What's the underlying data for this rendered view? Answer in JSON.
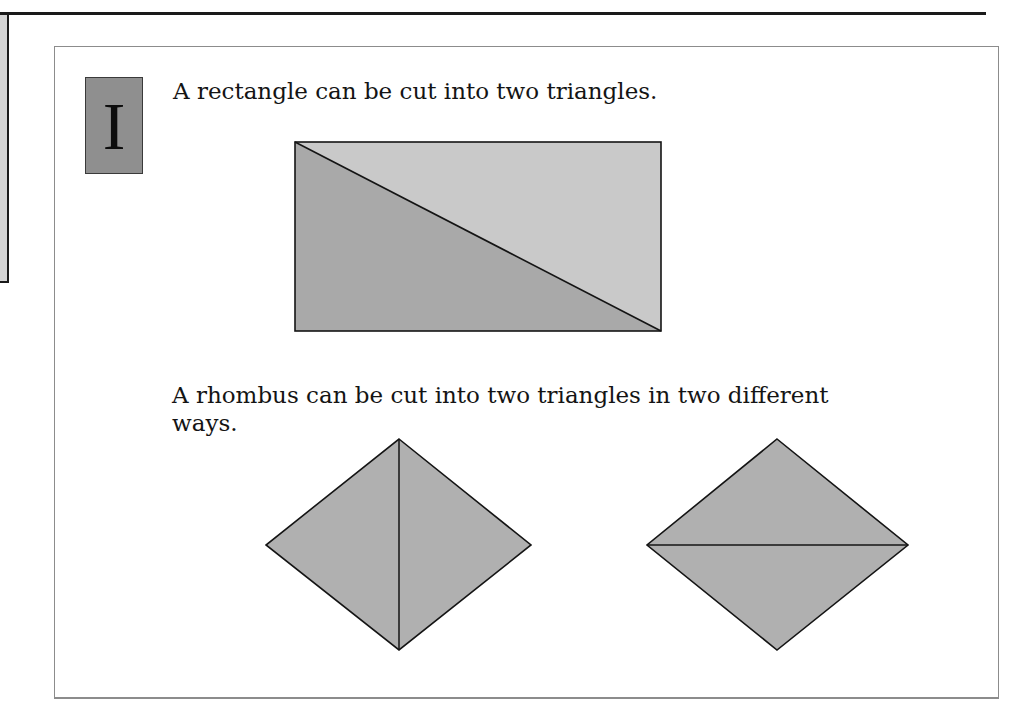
{
  "page": {
    "section_badge": "I",
    "statements": [
      "A rectangle can be cut into two triangles.",
      "A rhombus can be cut into two triangles in two different",
      "ways."
    ]
  },
  "figures": {
    "rectangle": {
      "description": "Rectangle split by a diagonal into two triangles",
      "upper_triangle_fill": "#c9c9c9",
      "lower_triangle_fill": "#a9a9a9"
    },
    "rhombus_vertical": {
      "description": "Rhombus split by vertical diagonal",
      "fill": "#b0b0b0"
    },
    "rhombus_horizontal": {
      "description": "Rhombus split by horizontal diagonal",
      "fill": "#b0b0b0"
    }
  },
  "colors": {
    "badge_fill": "#8f8f8f",
    "stroke": "#141414",
    "panel_border": "#8c8c8c"
  }
}
